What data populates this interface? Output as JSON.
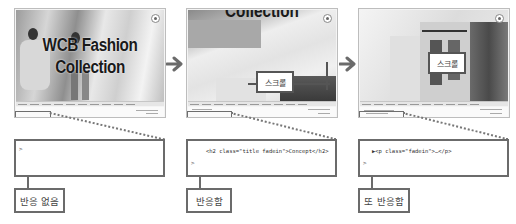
{
  "panels": [
    {
      "hero_title_line1": "WCB Fashion",
      "hero_title_line2": "Collection",
      "code_line": "",
      "code_brace": ">",
      "label": "반응 없음"
    },
    {
      "hero_title_cut": "Collection",
      "scroll_label": "스크롤",
      "code_line": "<h2 class=\"title fadein\">Concept</h2>",
      "code_brace": ">",
      "label": "반응함"
    },
    {
      "scroll_label": "스크롤",
      "code_line": "▶<p class=\"fadein\">…</p>",
      "code_brace": ">",
      "label": "또 반응함"
    }
  ],
  "icons": {
    "arrow": "arrow-right-icon",
    "close": "close-circle-icon"
  },
  "colors": {
    "border": "#6b6b6b",
    "arrow": "#6b6b6b"
  }
}
